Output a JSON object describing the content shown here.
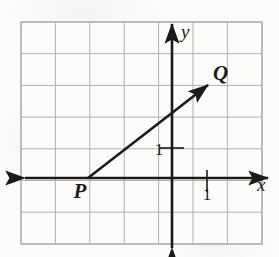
{
  "figure": {
    "kind": "coordinate-plane-ray",
    "background_color": "#fbfbfa",
    "grid_color": "#b0b0b0",
    "axis_color": "#1a1a1a",
    "ray_color": "#1a1a1a"
  },
  "grid": {
    "left": 21,
    "top": 22,
    "right": 262,
    "bottom": 244,
    "columns": 7,
    "rows": 7,
    "cell_width": 34.4,
    "cell_height": 31.7,
    "x_lines": [
      21,
      55.4,
      89.8,
      124.2,
      158.6,
      193,
      227.4,
      261.8
    ],
    "y_lines": [
      22,
      53.7,
      85.4,
      117.1,
      148.8,
      180.5,
      212.2,
      243.9
    ]
  },
  "axes": {
    "origin": {
      "x": 172,
      "y": 178
    },
    "x_axis": {
      "label": "x",
      "label_x": 257,
      "label_y": 191,
      "start_x": 25,
      "end_x": 268,
      "y": 178,
      "arrow_left": true,
      "arrow_right": true
    },
    "y_axis": {
      "label": "y",
      "label_x": 181,
      "label_y": 38,
      "x": 172,
      "start_y": 248,
      "end_y": 24,
      "arrow_up": true,
      "arrow_down": true
    },
    "ticks": [
      {
        "name": "y-unit-tick",
        "label": "1",
        "axis": "y",
        "tick_x1": 160,
        "tick_x2": 184,
        "tick_y": 148,
        "label_x": 159,
        "label_y": 155
      },
      {
        "name": "x-unit-tick",
        "label": "1",
        "axis": "x",
        "tick_x": 207,
        "tick_y1": 170,
        "tick_y2": 192,
        "label_x": 207,
        "label_y": 200
      }
    ]
  },
  "ray": {
    "name": "ray-PQ",
    "from": {
      "x": 88,
      "y": 178
    },
    "to": {
      "x": 208,
      "y": 85
    },
    "arrowhead_at": "Q",
    "stroke_width": 2.6
  },
  "points": [
    {
      "id": "P",
      "label": "P",
      "x": 88,
      "y": 178,
      "label_x": 80,
      "label_y": 198
    },
    {
      "id": "Q",
      "label": "Q",
      "x": 208,
      "y": 85,
      "label_x": 213,
      "label_y": 80
    }
  ]
}
